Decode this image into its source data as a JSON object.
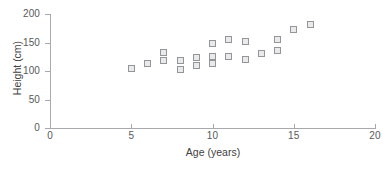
{
  "chart_data": {
    "type": "scatter",
    "title": "",
    "xlabel": "Age (years)",
    "ylabel": "Height (cm)",
    "xlim": [
      0,
      20
    ],
    "ylim": [
      0,
      200
    ],
    "xticks": [
      0,
      5,
      10,
      15,
      20
    ],
    "yticks": [
      0,
      50,
      100,
      150,
      200
    ],
    "xtick_labels": [
      "0",
      "5",
      "10",
      "15",
      "20"
    ],
    "ytick_labels": [
      "0",
      "50",
      "100",
      "150",
      "200"
    ],
    "grid": false,
    "legend": null,
    "marker_style": "open-square",
    "marker_color": "#939598",
    "marker_fill": "#e9eaeb",
    "axis_color": "#a7a9ac",
    "text_color": "#58595b",
    "points": [
      {
        "x": 5,
        "y": 105
      },
      {
        "x": 6,
        "y": 114
      },
      {
        "x": 7,
        "y": 132
      },
      {
        "x": 7,
        "y": 118
      },
      {
        "x": 8,
        "y": 118
      },
      {
        "x": 8,
        "y": 103
      },
      {
        "x": 9,
        "y": 123
      },
      {
        "x": 9,
        "y": 110
      },
      {
        "x": 10,
        "y": 148
      },
      {
        "x": 10,
        "y": 126
      },
      {
        "x": 10,
        "y": 114
      },
      {
        "x": 11,
        "y": 156
      },
      {
        "x": 11,
        "y": 126
      },
      {
        "x": 12,
        "y": 152
      },
      {
        "x": 12,
        "y": 121
      },
      {
        "x": 13,
        "y": 131
      },
      {
        "x": 14,
        "y": 156
      },
      {
        "x": 14,
        "y": 136
      },
      {
        "x": 15,
        "y": 172
      },
      {
        "x": 16,
        "y": 182
      }
    ]
  }
}
